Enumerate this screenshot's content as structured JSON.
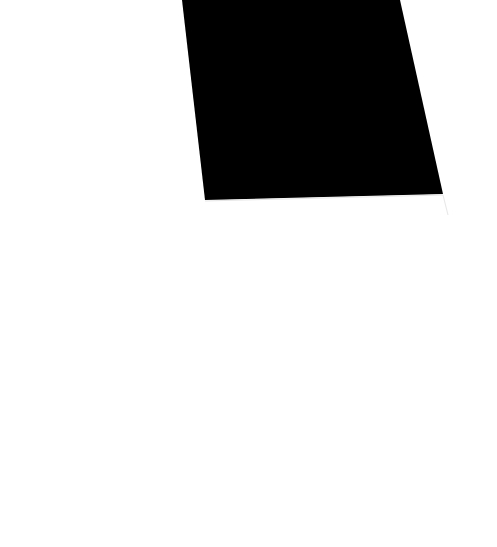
{
  "scene": {
    "background_color": "#ffffff",
    "shape": {
      "type": "quadrilateral",
      "fill": "#000000",
      "points": "182,0 400,0 443,194 205,200"
    },
    "edge_line": {
      "stroke": "#e6e6e6",
      "points": "205,201 443,195 448,215"
    }
  }
}
